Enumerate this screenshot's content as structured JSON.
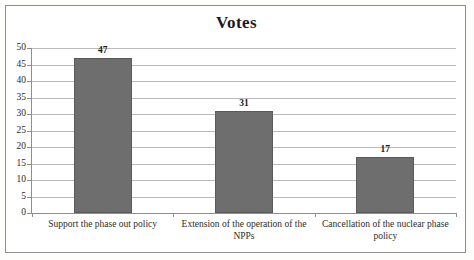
{
  "chart_data": {
    "type": "bar",
    "title": "Votes",
    "xlabel": "",
    "ylabel": "",
    "categories": [
      "Support the phase out policy",
      "Extension of the operation of the NPPs",
      "Cancellation of the nuclear phase policy"
    ],
    "values": [
      47,
      31,
      17
    ],
    "value_labels": [
      "47",
      "31",
      "17"
    ],
    "ylim": [
      0,
      50
    ],
    "ytick_labels": [
      "0",
      "5",
      "10",
      "15",
      "20",
      "25",
      "30",
      "35",
      "40",
      "45",
      "50"
    ],
    "ytick_values": [
      0,
      5,
      10,
      15,
      20,
      25,
      30,
      35,
      40,
      45,
      50
    ],
    "grid": true,
    "legend": false,
    "legend_position": "none",
    "bar_color": "#6e6e6e",
    "gridline_color": "#b9b9b9",
    "axis_color": "#8e8e8e",
    "text_color": "#1a1a1a",
    "background_color": "#ffffff"
  }
}
